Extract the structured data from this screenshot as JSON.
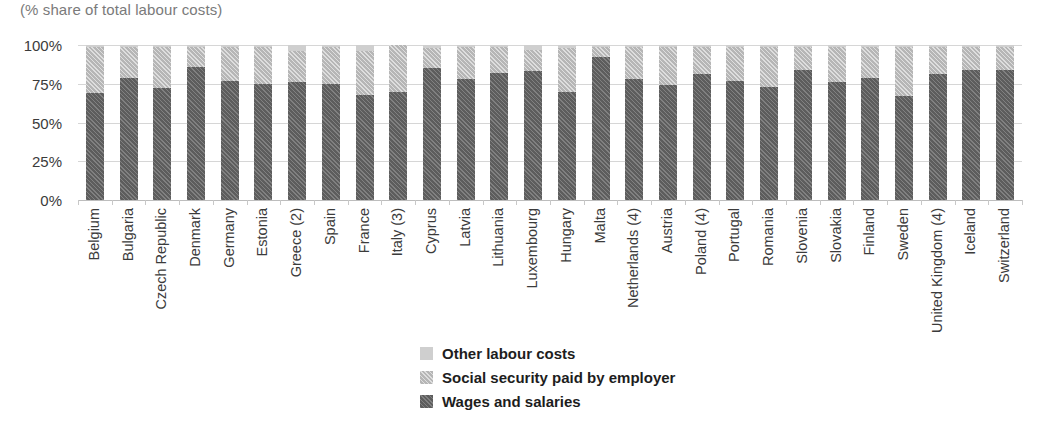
{
  "subtitle": "(% share of total labour costs)",
  "axis": {
    "y_ticks": [
      "0%",
      "25%",
      "50%",
      "75%",
      "100%"
    ],
    "y_tick_values": [
      0,
      25,
      50,
      75,
      100
    ]
  },
  "legend": {
    "items": [
      {
        "label": "Other labour costs",
        "swatch": "light-solid-swatch",
        "color": "#cfcfcf"
      },
      {
        "label": "Social security paid by employer",
        "swatch": "light-hatched-swatch",
        "color": "#b6b6b6"
      },
      {
        "label": "Wages and salaries",
        "swatch": "dark-hatched-swatch",
        "color": "#5d5d5d"
      }
    ]
  },
  "chart_data": {
    "type": "bar",
    "stacked": true,
    "title": "",
    "subtitle": "(% share of total labour costs)",
    "xlabel": "",
    "ylabel": "",
    "ylim": [
      0,
      100
    ],
    "grid": true,
    "legend_position": "bottom-center",
    "categories": [
      "Belgium",
      "Bulgaria",
      "Czech Republic",
      "Denmark",
      "Germany",
      "Estonia",
      "Greece (2)",
      "Spain",
      "France",
      "Italy (3)",
      "Cyprus",
      "Latvia",
      "Lithuania",
      "Luxembourg",
      "Hungary",
      "Malta",
      "Netherlands (4)",
      "Austria",
      "Poland (4)",
      "Portugal",
      "Romania",
      "Slovenia",
      "Slovakia",
      "Finland",
      "Sweden",
      "United Kingdom (4)",
      "Iceland",
      "Switzerland"
    ],
    "series": [
      {
        "name": "Wages and salaries",
        "color": "#5d5d5d",
        "values": [
          69,
          79,
          72,
          86,
          77,
          75,
          76,
          75,
          68,
          70,
          85,
          78,
          82,
          83,
          70,
          92,
          78,
          74,
          81,
          77,
          73,
          84,
          76,
          79,
          67,
          81,
          84,
          84
        ]
      },
      {
        "name": "Social security paid by employer",
        "color": "#b6b6b6",
        "values": [
          30,
          20,
          27,
          13,
          22,
          24,
          20,
          24,
          28,
          30,
          13,
          21,
          17,
          14,
          28,
          7,
          21,
          25,
          18,
          22,
          26,
          15,
          23,
          20,
          32,
          18,
          15,
          15
        ]
      },
      {
        "name": "Other labour costs",
        "color": "#cfcfcf",
        "values": [
          1,
          1,
          1,
          1,
          1,
          1,
          4,
          1,
          4,
          0,
          2,
          1,
          1,
          3,
          2,
          1,
          1,
          1,
          1,
          1,
          1,
          1,
          1,
          1,
          1,
          1,
          1,
          1
        ]
      }
    ]
  }
}
